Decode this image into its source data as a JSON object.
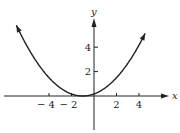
{
  "chart_data": {
    "type": "line",
    "title": "",
    "xlabel": "x",
    "ylabel": "y",
    "function": "y = (x + 1)^2 / 6",
    "x_ticks": [
      -4,
      -2,
      2,
      4
    ],
    "y_ticks": [
      2,
      4
    ],
    "x_tick_labels": [
      "− 4",
      "− 2",
      "2",
      "4"
    ],
    "y_tick_labels": [
      "2",
      "4"
    ],
    "xlim": [
      -8.4,
      7.5
    ],
    "ylim": [
      -3.2,
      7.5
    ],
    "grid": false,
    "legend": "none",
    "series": [
      {
        "name": "parabola",
        "x": [
          -6.9,
          -6,
          -5,
          -4,
          -3,
          -2,
          -1,
          0,
          1,
          2,
          3,
          4,
          4.5
        ],
        "values": [
          5.8,
          4.17,
          2.67,
          1.5,
          0.67,
          0.17,
          0,
          0.17,
          0.67,
          1.5,
          2.67,
          4.17,
          5.04
        ]
      }
    ],
    "arrows_on_curve_ends": true,
    "arrows_on_axes": [
      "x-positive",
      "y-positive"
    ]
  }
}
